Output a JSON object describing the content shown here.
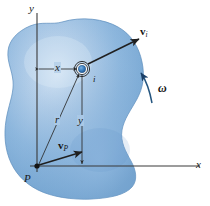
{
  "figure": {
    "body_label": "rigid-body-blob",
    "colors": {
      "body_fill_light": "#cfe0f2",
      "body_fill_mid": "#8db6dd",
      "body_fill_dark": "#6b9dcc",
      "body_edge": "#5585b5",
      "line": "#2b2b2b",
      "axis": "#3a3a3a",
      "marker_core": "#2f6fb0",
      "background": "#ffffff"
    }
  },
  "axes": {
    "y_label": "y",
    "x_label": "x",
    "origin_label": "P"
  },
  "points": {
    "origin": {
      "label": "P",
      "x": 37,
      "y": 166
    },
    "particle": {
      "label": "i",
      "x": 82,
      "y": 68
    }
  },
  "dimensions": {
    "horizontal": {
      "label": "x",
      "description": "horizontal distance from y-axis to particle i"
    },
    "vertical": {
      "label": "y",
      "description": "vertical distance from x-axis line to particle i"
    },
    "radial": {
      "label": "r",
      "description": "position vector magnitude from P to particle i"
    }
  },
  "vectors": {
    "velocity_i": {
      "symbol": "v",
      "subscript": "i",
      "description": "velocity of particle i"
    },
    "velocity_P": {
      "symbol": "v",
      "subscript": "P",
      "description": "velocity of point P"
    }
  },
  "angular": {
    "label": "ω",
    "description": "angular velocity of the rigid body, counterclockwise"
  }
}
